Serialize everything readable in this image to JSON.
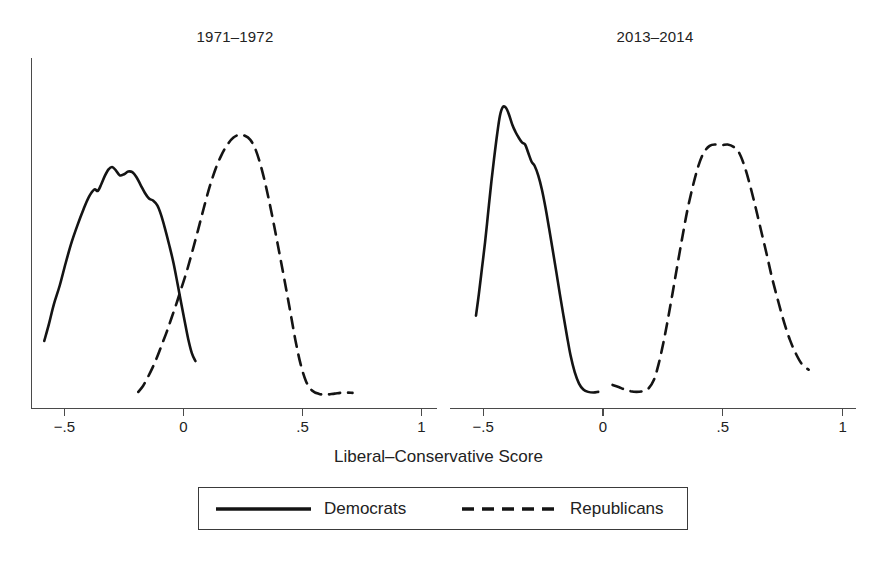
{
  "figure": {
    "xlabel": "Liberal–Conservative Score",
    "legend": {
      "democrats_label": "Democrats",
      "republicans_label": "Republicans"
    }
  },
  "chart_data": {
    "type": "line",
    "title": "",
    "subtitle": "",
    "xlabel": "Liberal–Conservative Score",
    "ylabel": "",
    "grid": false,
    "legend_position": "bottom-center",
    "legend_entries": [
      "Democrats",
      "Republicans"
    ],
    "xlim": [
      -0.62,
      1.02
    ],
    "xticks": [
      -0.5,
      0,
      0.5,
      1
    ],
    "xticklabels": [
      "−.5",
      "0",
      ".5",
      "1"
    ],
    "ylim": [
      0,
      1
    ],
    "yticks": [],
    "yticklabels": [],
    "panels": [
      {
        "title": "1971–1972",
        "series": [
          {
            "name": "Democrats",
            "style": "solid",
            "points": [
              [
                -0.585,
                0.195
              ],
              [
                -0.565,
                0.245
              ],
              [
                -0.545,
                0.3
              ],
              [
                -0.52,
                0.355
              ],
              [
                -0.495,
                0.42
              ],
              [
                -0.47,
                0.48
              ],
              [
                -0.445,
                0.53
              ],
              [
                -0.42,
                0.575
              ],
              [
                -0.398,
                0.61
              ],
              [
                -0.375,
                0.632
              ],
              [
                -0.36,
                0.628
              ],
              [
                -0.345,
                0.648
              ],
              [
                -0.33,
                0.672
              ],
              [
                -0.315,
                0.69
              ],
              [
                -0.3,
                0.697
              ],
              [
                -0.285,
                0.688
              ],
              [
                -0.268,
                0.673
              ],
              [
                -0.25,
                0.676
              ],
              [
                -0.232,
                0.684
              ],
              [
                -0.215,
                0.682
              ],
              [
                -0.198,
                0.668
              ],
              [
                -0.18,
                0.645
              ],
              [
                -0.162,
                0.622
              ],
              [
                -0.145,
                0.606
              ],
              [
                -0.128,
                0.6
              ],
              [
                -0.11,
                0.586
              ],
              [
                -0.095,
                0.56
              ],
              [
                -0.078,
                0.52
              ],
              [
                -0.06,
                0.472
              ],
              [
                -0.042,
                0.42
              ],
              [
                -0.025,
                0.36
              ],
              [
                -0.01,
                0.305
              ],
              [
                0.005,
                0.252
              ],
              [
                0.02,
                0.2
              ],
              [
                0.035,
                0.16
              ],
              [
                0.05,
                0.137
              ]
            ]
          },
          {
            "name": "Republicans",
            "style": "dashed",
            "points": [
              [
                -0.19,
                0.048
              ],
              [
                -0.17,
                0.065
              ],
              [
                -0.15,
                0.09
              ],
              [
                -0.13,
                0.118
              ],
              [
                -0.11,
                0.15
              ],
              [
                -0.09,
                0.186
              ],
              [
                -0.07,
                0.222
              ],
              [
                -0.05,
                0.262
              ],
              [
                -0.03,
                0.302
              ],
              [
                -0.01,
                0.345
              ],
              [
                0.012,
                0.392
              ],
              [
                0.035,
                0.448
              ],
              [
                0.06,
                0.512
              ],
              [
                0.085,
                0.578
              ],
              [
                0.11,
                0.64
              ],
              [
                0.135,
                0.692
              ],
              [
                0.16,
                0.732
              ],
              [
                0.185,
                0.762
              ],
              [
                0.21,
                0.782
              ],
              [
                0.235,
                0.79
              ],
              [
                0.258,
                0.787
              ],
              [
                0.28,
                0.776
              ],
              [
                0.3,
                0.752
              ],
              [
                0.32,
                0.712
              ],
              [
                0.34,
                0.66
              ],
              [
                0.36,
                0.598
              ],
              [
                0.38,
                0.53
              ],
              [
                0.402,
                0.452
              ],
              [
                0.425,
                0.368
              ],
              [
                0.448,
                0.282
              ],
              [
                0.47,
                0.198
              ],
              [
                0.492,
                0.128
              ],
              [
                0.515,
                0.078
              ],
              [
                0.54,
                0.052
              ],
              [
                0.57,
                0.042
              ],
              [
                0.6,
                0.04
              ],
              [
                0.635,
                0.043
              ],
              [
                0.675,
                0.046
              ],
              [
                0.71,
                0.045
              ]
            ]
          }
        ]
      },
      {
        "title": "2013–2014",
        "series": [
          {
            "name": "Democrats",
            "style": "solid",
            "points": [
              [
                -0.53,
                0.268
              ],
              [
                -0.518,
                0.33
              ],
              [
                -0.505,
                0.405
              ],
              [
                -0.492,
                0.48
              ],
              [
                -0.48,
                0.56
              ],
              [
                -0.468,
                0.64
              ],
              [
                -0.455,
                0.718
              ],
              [
                -0.442,
                0.79
              ],
              [
                -0.43,
                0.845
              ],
              [
                -0.418,
                0.87
              ],
              [
                -0.405,
                0.868
              ],
              [
                -0.392,
                0.848
              ],
              [
                -0.378,
                0.818
              ],
              [
                -0.365,
                0.798
              ],
              [
                -0.352,
                0.782
              ],
              [
                -0.338,
                0.768
              ],
              [
                -0.325,
                0.762
              ],
              [
                -0.312,
                0.738
              ],
              [
                -0.298,
                0.712
              ],
              [
                -0.285,
                0.7
              ],
              [
                -0.27,
                0.672
              ],
              [
                -0.255,
                0.632
              ],
              [
                -0.24,
                0.58
              ],
              [
                -0.225,
                0.52
              ],
              [
                -0.21,
                0.458
              ],
              [
                -0.195,
                0.395
              ],
              [
                -0.18,
                0.33
              ],
              [
                -0.165,
                0.268
              ],
              [
                -0.15,
                0.208
              ],
              [
                -0.135,
                0.152
              ],
              [
                -0.118,
                0.105
              ],
              [
                -0.1,
                0.072
              ],
              [
                -0.082,
                0.055
              ],
              [
                -0.062,
                0.048
              ],
              [
                -0.04,
                0.046
              ],
              [
                -0.02,
                0.048
              ]
            ]
          },
          {
            "name": "Republicans",
            "style": "dashed",
            "points": [
              [
                0.04,
                0.068
              ],
              [
                0.065,
                0.062
              ],
              [
                0.09,
                0.055
              ],
              [
                0.115,
                0.05
              ],
              [
                0.14,
                0.048
              ],
              [
                0.165,
                0.05
              ],
              [
                0.19,
                0.058
              ],
              [
                0.212,
                0.082
              ],
              [
                0.232,
                0.128
              ],
              [
                0.252,
                0.19
              ],
              [
                0.272,
                0.262
              ],
              [
                0.292,
                0.34
              ],
              [
                0.312,
                0.42
              ],
              [
                0.332,
                0.498
              ],
              [
                0.352,
                0.572
              ],
              [
                0.375,
                0.642
              ],
              [
                0.398,
                0.7
              ],
              [
                0.42,
                0.738
              ],
              [
                0.445,
                0.758
              ],
              [
                0.47,
                0.762
              ],
              [
                0.495,
                0.76
              ],
              [
                0.52,
                0.762
              ],
              [
                0.545,
                0.755
              ],
              [
                0.568,
                0.738
              ],
              [
                0.59,
                0.7
              ],
              [
                0.612,
                0.648
              ],
              [
                0.635,
                0.585
              ],
              [
                0.658,
                0.518
              ],
              [
                0.682,
                0.448
              ],
              [
                0.705,
                0.378
              ],
              [
                0.73,
                0.312
              ],
              [
                0.755,
                0.25
              ],
              [
                0.78,
                0.198
              ],
              [
                0.805,
                0.158
              ],
              [
                0.83,
                0.128
              ],
              [
                0.858,
                0.112
              ]
            ]
          }
        ]
      }
    ]
  }
}
